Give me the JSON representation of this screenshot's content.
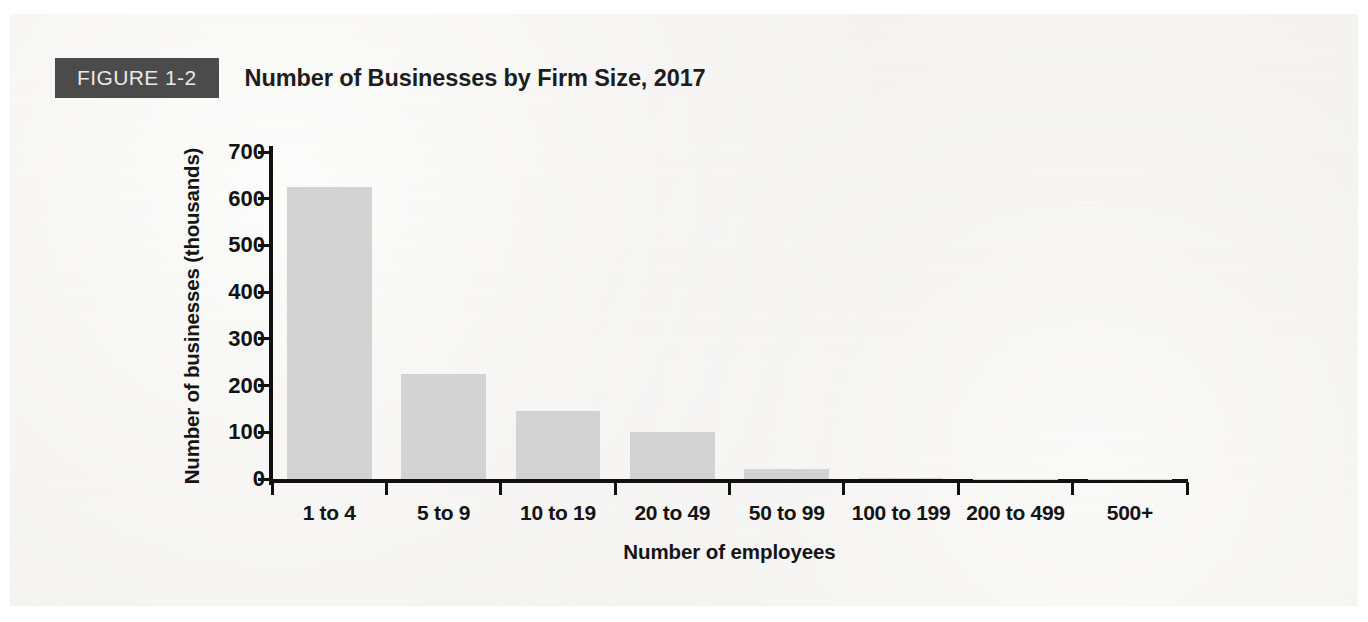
{
  "figure": {
    "badge_label": "FIGURE 1-2",
    "title": "Number of Businesses by Firm Size, 2017",
    "badge_bg": "#4b4b4b",
    "badge_text_color": "#e9e9e9",
    "page_bg": "#f3f2f0"
  },
  "chart_data": {
    "type": "bar",
    "title": "Number of Businesses by Firm Size, 2017",
    "subtitle": "",
    "xlabel": "Number of employees",
    "ylabel": "Number of businesses (thousands)",
    "categories": [
      "1 to 4",
      "5 to 9",
      "10 to 19",
      "20 to 49",
      "50 to 99",
      "100 to 199",
      "200 to 499",
      "500+"
    ],
    "values": [
      625,
      225,
      145,
      100,
      22,
      2,
      1,
      0.6
    ],
    "ylim": [
      0,
      700
    ],
    "ytick_values": [
      0,
      100,
      200,
      300,
      400,
      500,
      600,
      700
    ],
    "ytick_labels": [
      "0",
      "100",
      "200",
      "300",
      "400",
      "500",
      "600",
      "700"
    ],
    "grid": false,
    "legend": null,
    "legend_position": "none",
    "bar_color": "#d3d3d3",
    "axis_color": "#111111"
  }
}
